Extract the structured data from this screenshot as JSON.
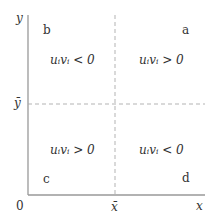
{
  "axes": {
    "y_label": "y",
    "x_label": "x",
    "origin_label": "0",
    "x_mean_label": "x̄",
    "y_mean_label": "ȳ"
  },
  "quadrants": {
    "a": {
      "label": "a",
      "expr": "uᵢvᵢ > 0"
    },
    "b": {
      "label": "b",
      "expr": "uᵢvᵢ < 0"
    },
    "c": {
      "label": "c",
      "expr": "uᵢvᵢ > 0"
    },
    "d": {
      "label": "d",
      "expr": "uᵢvᵢ < 0"
    }
  },
  "colors": {
    "axis": "#999999",
    "dash": "#aaaaaa",
    "text": "#333333"
  }
}
